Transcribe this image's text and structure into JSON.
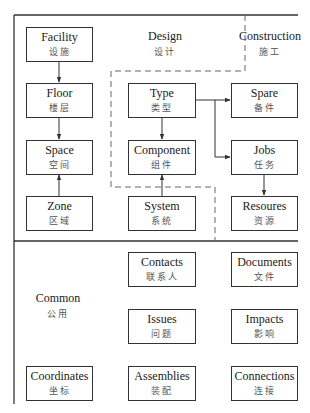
{
  "regions": {
    "design": {
      "en": "Design",
      "zh": "设计"
    },
    "construction": {
      "en": "Construction",
      "zh": "施工"
    },
    "common": {
      "en": "Common",
      "zh": "公用"
    }
  },
  "boxes": {
    "facility": {
      "en": "Facility",
      "zh": "设施"
    },
    "floor": {
      "en": "Floor",
      "zh": "楼层"
    },
    "space": {
      "en": "Space",
      "zh": "空间"
    },
    "zone": {
      "en": "Zone",
      "zh": "区域"
    },
    "type": {
      "en": "Type",
      "zh": "类型"
    },
    "component": {
      "en": "Component",
      "zh": "组件"
    },
    "system": {
      "en": "System",
      "zh": "系统"
    },
    "spare": {
      "en": "Spare",
      "zh": "备件"
    },
    "jobs": {
      "en": "Jobs",
      "zh": "任务"
    },
    "resoures": {
      "en": "Resoures",
      "zh": "资源"
    },
    "contacts": {
      "en": "Contacts",
      "zh": "联系人"
    },
    "documents": {
      "en": "Documents",
      "zh": "文件"
    },
    "issues": {
      "en": "Issues",
      "zh": "问题"
    },
    "impacts": {
      "en": "Impacts",
      "zh": "影响"
    },
    "coordinates": {
      "en": "Coordinates",
      "zh": "坐标"
    },
    "assemblies": {
      "en": "Assemblies",
      "zh": "装配"
    },
    "connections": {
      "en": "Connections",
      "zh": "连接"
    }
  },
  "edges": [
    {
      "from": "facility",
      "to": "floor"
    },
    {
      "from": "floor",
      "to": "space"
    },
    {
      "from": "zone",
      "to": "space"
    },
    {
      "from": "type",
      "to": "component"
    },
    {
      "from": "system",
      "to": "component"
    },
    {
      "from": "type",
      "to": "spare"
    },
    {
      "from": "type",
      "to": "jobs"
    },
    {
      "from": "jobs",
      "to": "resoures"
    }
  ],
  "colors": {
    "line": "#333333",
    "dashed": "#666666",
    "background": "#ffffff"
  }
}
